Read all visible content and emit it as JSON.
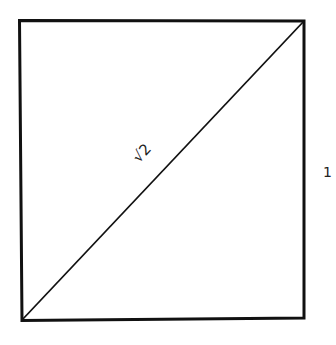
{
  "diagram": {
    "shape": "unit square with diagonal",
    "diagonal_label": "√2",
    "side_label": "1",
    "colors": {
      "stroke": "#111111",
      "text": "#222222",
      "background": "#ffffff"
    }
  }
}
